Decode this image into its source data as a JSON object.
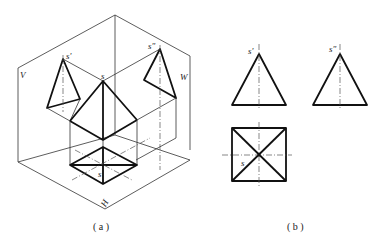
{
  "figure_a": {
    "caption": "( a )",
    "plane_labels": {
      "v": "V",
      "w": "W",
      "h": "H"
    },
    "point_labels": {
      "s_front": "s'",
      "s_side": "s\"",
      "s_apex": "s",
      "s_top": "s"
    }
  },
  "figure_b": {
    "caption": "( b )",
    "point_labels": {
      "s_front": "s'",
      "s_side": "s\"",
      "s_top": "s"
    }
  }
}
